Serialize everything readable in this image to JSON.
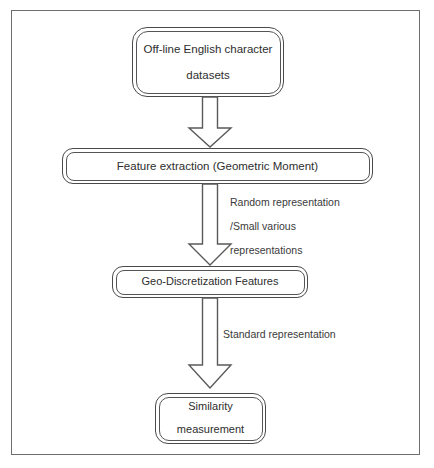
{
  "diagram": {
    "background_color": "#ffffff",
    "frame_color": "#6e6e6e",
    "node_border_color": "#4a4a4a",
    "arrow_stroke_color": "#595959",
    "text_color": "#2e2e2e",
    "nodes": [
      {
        "id": "datasets",
        "lines": [
          "Off-line English character",
          "datasets"
        ]
      },
      {
        "id": "feature_extraction",
        "lines": [
          "Feature extraction  (Geometric Moment)"
        ]
      },
      {
        "id": "geo_discretization",
        "lines": [
          "Geo-Discretization Features"
        ]
      },
      {
        "id": "similarity",
        "lines": [
          "Similarity",
          "measurement"
        ]
      }
    ],
    "edge_labels": {
      "random_line1": "Random representation",
      "random_line2": "/Small various",
      "random_line3": "representations",
      "standard": "Standard representation"
    }
  }
}
